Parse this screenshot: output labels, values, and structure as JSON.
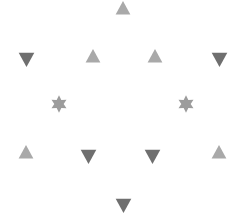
{
  "canvas": {
    "width": 237,
    "height": 217,
    "background": "#ffffff"
  },
  "colors": {
    "up_triangle": "#a9a9a9",
    "down_triangle": "#6f6f6f",
    "star": "#9c9c9c"
  },
  "shapes": [
    {
      "id": "s1",
      "type": "triangle-up",
      "cx": 123,
      "cy": 8,
      "size": 16
    },
    {
      "id": "s2",
      "type": "triangle-down",
      "cx": 26,
      "cy": 59,
      "size": 17
    },
    {
      "id": "s3",
      "type": "triangle-up",
      "cx": 93,
      "cy": 56,
      "size": 16
    },
    {
      "id": "s4",
      "type": "triangle-up",
      "cx": 155,
      "cy": 56,
      "size": 16
    },
    {
      "id": "s5",
      "type": "triangle-down",
      "cx": 219,
      "cy": 59,
      "size": 17
    },
    {
      "id": "s6",
      "type": "star-6",
      "cx": 59,
      "cy": 104,
      "size": 18
    },
    {
      "id": "s7",
      "type": "star-6",
      "cx": 186,
      "cy": 104,
      "size": 18
    },
    {
      "id": "s8",
      "type": "triangle-up",
      "cx": 26,
      "cy": 152,
      "size": 16
    },
    {
      "id": "s9",
      "type": "triangle-down",
      "cx": 88,
      "cy": 156,
      "size": 17
    },
    {
      "id": "s10",
      "type": "triangle-down",
      "cx": 152,
      "cy": 156,
      "size": 17
    },
    {
      "id": "s11",
      "type": "triangle-up",
      "cx": 219,
      "cy": 152,
      "size": 16
    },
    {
      "id": "s12",
      "type": "triangle-down",
      "cx": 123,
      "cy": 205,
      "size": 17
    }
  ]
}
